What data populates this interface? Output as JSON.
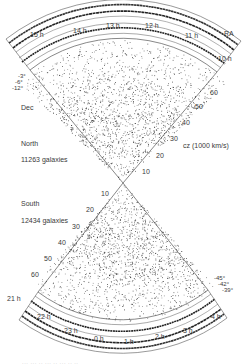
{
  "figure": {
    "ra_label": "RA",
    "dec_label": "Dec",
    "cz_label": "cz (1000 km/s)",
    "north": {
      "name": "North",
      "count": "11263 galaxies",
      "ra_ticks": [
        "15 h",
        "14 h",
        "13 h",
        "12 h",
        "11 h",
        "10 h"
      ],
      "dec_ticks": [
        "-3°",
        "-6°",
        "-12°"
      ],
      "cz_ticks": [
        "60",
        "50",
        "40",
        "30",
        "20",
        "10"
      ]
    },
    "south": {
      "name": "South",
      "count": "12434 galaxies",
      "ra_ticks": [
        "21 h",
        "22 h",
        "23 h",
        "0 h",
        "1 h",
        "2 h",
        "3 h",
        "4 h"
      ],
      "dec_ticks": [
        "-45°",
        "-42°",
        "-39°"
      ],
      "cz_ticks": [
        "10",
        "20",
        "30",
        "40",
        "50",
        "60"
      ]
    },
    "caption": "··· ··· ·· ··· ·· ··· ·· ··"
  },
  "chart_data": {
    "type": "scatter",
    "title": "",
    "xlabel": "RA",
    "ylabel": "cz (1000 km/s)",
    "series": [
      {
        "name": "North",
        "count": 11263,
        "ra_range_h": [
          10,
          15
        ],
        "dec_bands_deg": [
          -3,
          -6,
          -12
        ],
        "cz_range": [
          0,
          60
        ]
      },
      {
        "name": "South",
        "count": 12434,
        "ra_range_h": [
          21,
          4
        ],
        "dec_bands_deg": [
          -39,
          -42,
          -45
        ],
        "cz_range": [
          0,
          60
        ]
      }
    ],
    "cz_ticks": [
      10,
      20,
      30,
      40,
      50,
      60
    ],
    "north_ra_ticks": [
      "10h",
      "11h",
      "12h",
      "13h",
      "14h",
      "15h"
    ],
    "south_ra_ticks": [
      "21h",
      "22h",
      "23h",
      "0h",
      "1h",
      "2h",
      "3h",
      "4h"
    ],
    "grid": false
  }
}
